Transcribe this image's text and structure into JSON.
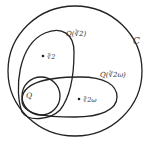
{
  "diagram": {
    "type": "nested-set-diagram",
    "sets": [
      {
        "id": "C",
        "label": "C"
      },
      {
        "id": "Q_cbrt2",
        "label": "Q(∛2)"
      },
      {
        "id": "Q_cbrt2_omega",
        "label": "Q(∛2ω)"
      },
      {
        "id": "Q",
        "label": "Q"
      }
    ],
    "points": [
      {
        "id": "cbrt2",
        "label": "∛2",
        "in": "Q_cbrt2"
      },
      {
        "id": "cbrt2_omega",
        "label": "∛2ω",
        "in": "Q_cbrt2_omega"
      }
    ],
    "colors": {
      "stroke": "#222222",
      "text": "#333333",
      "background": "#ffffff"
    }
  }
}
